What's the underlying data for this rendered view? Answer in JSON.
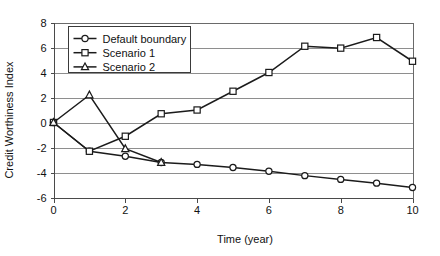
{
  "chart_data": {
    "type": "line",
    "title": "",
    "xlabel": "Time (year)",
    "ylabel": "Credit Worthiness Index",
    "x": [
      0,
      1,
      2,
      3,
      4,
      5,
      6,
      7,
      8,
      9,
      10
    ],
    "xlim": [
      0,
      10
    ],
    "ylim": [
      -6,
      8
    ],
    "xticks": [
      "0",
      "2",
      "4",
      "6",
      "8",
      "10"
    ],
    "xtick_values": [
      0,
      2,
      4,
      6,
      8,
      10
    ],
    "yticks": [
      "8",
      "6",
      "4",
      "2",
      "0",
      "-2",
      "-4",
      "-6"
    ],
    "ytick_values": [
      8,
      6,
      4,
      2,
      0,
      -2,
      -4,
      -6
    ],
    "grid": true,
    "grid_axis": "y",
    "legend_position": "upper left",
    "series": [
      {
        "name": "Default boundary",
        "marker": "circle",
        "values": [
          0,
          -2.3,
          -2.7,
          -3.2,
          -3.35,
          -3.6,
          -3.9,
          -4.25,
          -4.55,
          -4.85,
          -5.2
        ]
      },
      {
        "name": "Scenario 1",
        "marker": "square",
        "values": [
          0,
          -2.3,
          -1.1,
          0.7,
          1.0,
          2.5,
          4.0,
          6.1,
          5.95,
          6.8,
          4.9
        ]
      },
      {
        "name": "Scenario 2",
        "marker": "triangle",
        "values": [
          0,
          2.2,
          -2.1,
          -3.2,
          null,
          null,
          null,
          null,
          null,
          null,
          null
        ]
      }
    ]
  },
  "legend": {
    "items": [
      {
        "label": "Default boundary",
        "marker": "circle"
      },
      {
        "label": "Scenario 1",
        "marker": "square"
      },
      {
        "label": "Scenario 2",
        "marker": "triangle"
      }
    ]
  },
  "colors": {
    "line": "#1b1b1b",
    "grid": "#8e8e8e",
    "axis": "#4a4a4a",
    "background": "#ffffff",
    "marker_fill": "#ffffff"
  }
}
